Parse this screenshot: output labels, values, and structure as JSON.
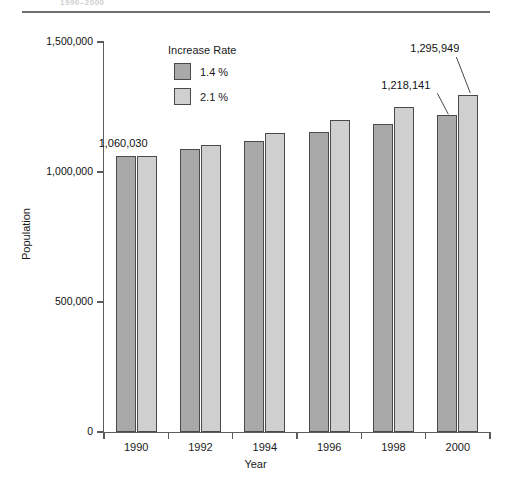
{
  "caption_fragment": "1990–2000",
  "chart_data": {
    "type": "bar",
    "title": "",
    "subtitle": "",
    "xlabel": "Year",
    "ylabel": "Population",
    "categories": [
      "1990",
      "1992",
      "1994",
      "1996",
      "1998",
      "2000"
    ],
    "series": [
      {
        "name": "1.4 %",
        "color": "#a9a9a9",
        "values": [
          1060030,
          1089934,
          1120681,
          1152295,
          1184801,
          1218141
        ]
      },
      {
        "name": "2.1 %",
        "color": "#cfcfcf",
        "values": [
          1060030,
          1104999,
          1151874,
          1200736,
          1251668,
          1295949
        ]
      }
    ],
    "ylim": [
      0,
      1500000
    ],
    "ytick_labels": [
      "0",
      "500,000",
      "1,000,000",
      "1,500,000"
    ],
    "ytick_values": [
      0,
      500000,
      1000000,
      1500000
    ],
    "grid": false,
    "legend": {
      "title": "Increase Rate",
      "position": "inside-top-left",
      "entries": [
        "1.4 %",
        "2.1 %"
      ]
    },
    "annotations": [
      {
        "text": "1,060,030",
        "target_category": "1990",
        "target_series": "both",
        "leader": false
      },
      {
        "text": "1,218,141",
        "target_category": "2000",
        "target_series": "1.4 %",
        "leader": true
      },
      {
        "text": "1,295,949",
        "target_category": "2000",
        "target_series": "2.1 %",
        "leader": true
      }
    ]
  }
}
